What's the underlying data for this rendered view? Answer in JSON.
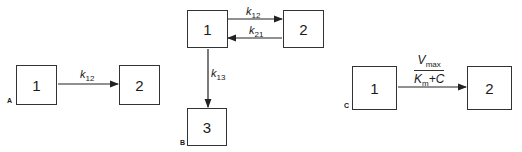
{
  "panels": {
    "A": {
      "label": "A",
      "compartments": [
        {
          "id": "1",
          "label": "1"
        },
        {
          "id": "2",
          "label": "2"
        }
      ],
      "transfers": [
        {
          "from": "1",
          "to": "2",
          "rate": "k",
          "rate_sub": "12"
        }
      ]
    },
    "B": {
      "label": "B",
      "compartments": [
        {
          "id": "1",
          "label": "1"
        },
        {
          "id": "2",
          "label": "2"
        },
        {
          "id": "3",
          "label": "3"
        }
      ],
      "transfers": [
        {
          "from": "1",
          "to": "2",
          "rate": "k",
          "rate_sub": "12"
        },
        {
          "from": "2",
          "to": "1",
          "rate": "k",
          "rate_sub": "21"
        },
        {
          "from": "1",
          "to": "3",
          "rate": "k",
          "rate_sub": "13"
        }
      ]
    },
    "C": {
      "label": "C",
      "compartments": [
        {
          "id": "1",
          "label": "1"
        },
        {
          "id": "2",
          "label": "2"
        }
      ],
      "transfers": [
        {
          "from": "1",
          "to": "2",
          "numerator": "V",
          "numerator_sub": "max",
          "denominator": "K",
          "denominator_sub": "m",
          "denominator_tail": "+C"
        }
      ]
    }
  }
}
